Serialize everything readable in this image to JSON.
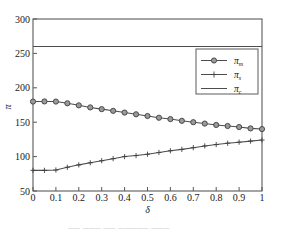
{
  "figure": {
    "background_color": "#ffffff",
    "frame_color": "#595959",
    "partial_caption": "── ─── ──   ───── ───"
  },
  "chart_data": {
    "type": "line",
    "title": "",
    "xlabel": "δ",
    "ylabel": "π",
    "xlim": [
      0,
      1
    ],
    "ylim": [
      50,
      300
    ],
    "xticks": [
      0,
      0.1,
      0.2,
      0.3,
      0.4,
      0.5,
      0.6,
      0.7,
      0.8,
      0.9,
      1
    ],
    "xticklabels": [
      "0",
      "0.1",
      "0.2",
      "0.3",
      "0.4",
      "0.5",
      "0.6",
      "0.7",
      "0.8",
      "0.9",
      "1"
    ],
    "yticks": [
      50,
      100,
      150,
      200,
      250,
      300
    ],
    "yticklabels": [
      "50",
      "100",
      "150",
      "200",
      "250",
      "300"
    ],
    "grid": false,
    "legend_position": "upper right",
    "x": [
      0,
      0.05,
      0.1,
      0.15,
      0.2,
      0.25,
      0.3,
      0.35,
      0.4,
      0.45,
      0.5,
      0.55,
      0.6,
      0.65,
      0.7,
      0.75,
      0.8,
      0.85,
      0.9,
      0.95,
      1
    ],
    "series": [
      {
        "name": "π_m",
        "label_base": "π",
        "label_sub": "m",
        "marker": "circle",
        "linestyle": "solid",
        "color": "#4d4d4d",
        "values": [
          180,
          180.2,
          180,
          177.5,
          174.5,
          171.5,
          169,
          166.5,
          164,
          161.5,
          159,
          156.5,
          154.5,
          152,
          150,
          148,
          146,
          144.5,
          143,
          141,
          140
        ]
      },
      {
        "name": "π_s",
        "label_base": "π",
        "label_sub": "s",
        "marker": "plus",
        "linestyle": "solid",
        "color": "#4d4d4d",
        "values": [
          80,
          80,
          80.5,
          84.5,
          88,
          91,
          94,
          97,
          100,
          101.5,
          103.5,
          106,
          108.5,
          110.5,
          113,
          115.5,
          117.5,
          119.5,
          121,
          122.5,
          124
        ]
      },
      {
        "name": "π_c",
        "label_base": "π",
        "label_sub": "c",
        "marker": "none",
        "linestyle": "solid",
        "color": "#4d4d4d",
        "constant_value": 260,
        "values": [
          260,
          260,
          260,
          260,
          260,
          260,
          260,
          260,
          260,
          260,
          260,
          260,
          260,
          260,
          260,
          260,
          260,
          260,
          260,
          260,
          260
        ]
      }
    ]
  }
}
